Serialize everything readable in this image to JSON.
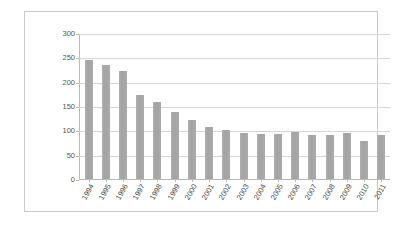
{
  "chart_data": {
    "type": "bar",
    "title": "",
    "subtitle": "",
    "xlabel": "",
    "ylabel": "",
    "categories": [
      "1994",
      "1995",
      "1996",
      "1997",
      "1998",
      "1999",
      "2000",
      "2001",
      "2002",
      "2003",
      "2004",
      "2005",
      "2006",
      "2007",
      "2008",
      "2009",
      "2010",
      "2011"
    ],
    "values": [
      245,
      234,
      222,
      172,
      158,
      137,
      122,
      107,
      100,
      95,
      93,
      92,
      96,
      91,
      91,
      94,
      78,
      90
    ],
    "series": [
      {
        "name": "",
        "values": [
          245,
          234,
          222,
          172,
          158,
          137,
          122,
          107,
          100,
          95,
          93,
          92,
          96,
          91,
          91,
          94,
          78,
          90
        ]
      }
    ],
    "ylim": [
      0,
      300
    ],
    "yticks": [
      0,
      50,
      100,
      150,
      200,
      250,
      300
    ],
    "ytick_labels": [
      "0",
      "50",
      "100",
      "150",
      "200",
      "250",
      "300"
    ],
    "grid": true,
    "grid_axis": "y",
    "legend": false,
    "legend_position": "none",
    "bar_color": "#a6a6a6",
    "gridline_color": "#d6d6d6",
    "axis_color": "#b9b9b9",
    "plot_background": "#ffffff",
    "border_color": "#c9c9c9",
    "xtick_label_rotation": -60
  }
}
